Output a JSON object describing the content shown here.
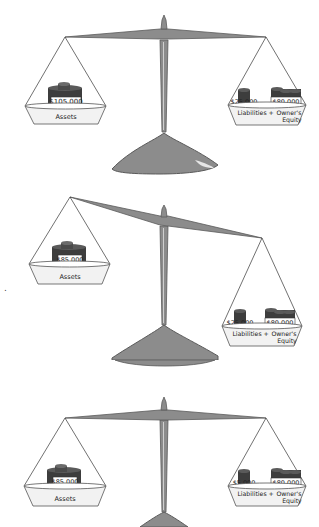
{
  "diagram": {
    "type": "balance-scale-accounting-equation",
    "colors": {
      "beam": "#8c8c8c",
      "beam_edge": "#5a5a5a",
      "pan_fill": "#f2f2f2",
      "pan_edge": "#555555",
      "coin_dark": "#3d3d3d",
      "coin_mid": "#5a5a5a",
      "label_bg": "#ffffff",
      "text": "#222222"
    },
    "stray_mark": ".",
    "scales": [
      {
        "state": "balanced",
        "left": {
          "amount": "$105,000",
          "label": "Assets"
        },
        "right": {
          "liabilities_amount": "$25,000",
          "equity_amount": "$80,000",
          "liabilities_label": "Liabilities",
          "plus": "+",
          "equity_label_1": "Owner's",
          "equity_label_2": "Equity"
        }
      },
      {
        "state": "unbalanced-right-heavy",
        "left": {
          "amount": "$85,000",
          "label": "Assets"
        },
        "right": {
          "liabilities_amount": "$25,000",
          "equity_amount": "$80,000",
          "liabilities_label": "Liabilities",
          "plus": "+",
          "equity_label_1": "Owner's",
          "equity_label_2": "Equity"
        }
      },
      {
        "state": "balanced",
        "left": {
          "amount": "$85,000",
          "label": "Assets"
        },
        "right": {
          "liabilities_amount": "$5,000",
          "equity_amount": "$80,000",
          "liabilities_label": "Liabilities",
          "plus": "+",
          "equity_label_1": "Owner's",
          "equity_label_2": "Equity"
        }
      }
    ]
  }
}
